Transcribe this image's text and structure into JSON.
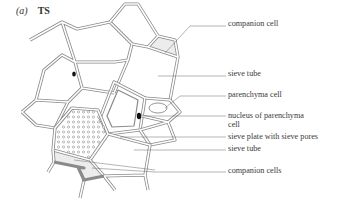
{
  "figure": {
    "panel_letter": "(a)",
    "panel_title": "TS",
    "colors": {
      "wall": "#8a8a8a",
      "shading": "#ececec",
      "nucleus": "#111111",
      "text": "#3a3a3a"
    }
  },
  "labels": [
    {
      "id": "companion-cell",
      "text": "companion cell"
    },
    {
      "id": "sieve-tube-top",
      "text": "sieve tube"
    },
    {
      "id": "parenchyma-cell",
      "text": "parenchyma cell"
    },
    {
      "id": "nucleus-parenchyma-line1",
      "text": "nucleus of parenchyma"
    },
    {
      "id": "nucleus-parenchyma-line2",
      "text": "cell"
    },
    {
      "id": "sieve-plate",
      "text": "sieve plate with sieve pores"
    },
    {
      "id": "sieve-tube-bottom",
      "text": "sieve tube"
    },
    {
      "id": "companion-cells",
      "text": "companion cells"
    }
  ]
}
